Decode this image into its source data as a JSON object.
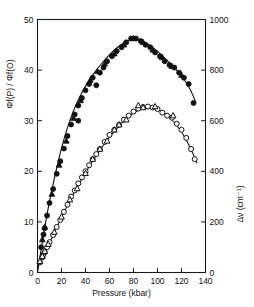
{
  "chart_data": {
    "type": "scatter",
    "title": "",
    "xlabel": "Pressure (kbar)",
    "ylabel": "Φf(P) / Φf(O)",
    "ylabel_right": "Δν (cm⁻¹)",
    "xlim": [
      0,
      140
    ],
    "ylim": [
      0,
      50
    ],
    "ylim_right": [
      0,
      1000
    ],
    "xticks": [
      0,
      20,
      40,
      60,
      80,
      100,
      120,
      140
    ],
    "yticks": [
      0,
      10,
      20,
      30,
      40,
      50
    ],
    "yticks_right": [
      0,
      200,
      400,
      600,
      800,
      1000
    ],
    "grid": false,
    "legend": "none",
    "series": [
      {
        "name": "Φf(P)/Φf(O) open circles",
        "axis": "left",
        "marker": "open-circle",
        "x": [
          2,
          4,
          5,
          6,
          8,
          10,
          13,
          16,
          19,
          22,
          25,
          28,
          31,
          34,
          37,
          40,
          43,
          46,
          49,
          52,
          56,
          60,
          64,
          68,
          72,
          76,
          80,
          84,
          88,
          92,
          96,
          100,
          104,
          108,
          112,
          116,
          120,
          124,
          128,
          131
        ],
        "y": [
          2.0,
          3.0,
          3.6,
          4.0,
          5.0,
          6.0,
          7.4,
          9.0,
          10.4,
          12.0,
          13.4,
          15.0,
          16.2,
          17.6,
          18.8,
          20.0,
          21.2,
          22.4,
          23.4,
          24.4,
          25.8,
          27.2,
          28.2,
          29.2,
          30.2,
          31.0,
          31.8,
          32.4,
          32.7,
          32.8,
          32.6,
          32.3,
          31.6,
          31.0,
          30.6,
          29.4,
          28.2,
          26.6,
          24.4,
          22.4
        ]
      },
      {
        "name": "Φf(P)/Φf(O) open triangles",
        "axis": "left",
        "marker": "open-triangle",
        "x": [
          2,
          4,
          6,
          9,
          14,
          20,
          27,
          33,
          40,
          46,
          52,
          58,
          64,
          68,
          74,
          84,
          88,
          98,
          113
        ],
        "y": [
          2.2,
          3.2,
          4.2,
          5.6,
          8.0,
          11.0,
          14.4,
          16.6,
          19.6,
          22.4,
          24.4,
          26.0,
          28.2,
          29.2,
          30.2,
          33.0,
          32.6,
          32.8,
          31.0
        ]
      },
      {
        "name": "Δν filled circles",
        "axis": "right",
        "marker": "filled-circle",
        "x": [
          3,
          5,
          6,
          8,
          10,
          13,
          16,
          19,
          22,
          25,
          28,
          31,
          34,
          34,
          37,
          40,
          43,
          46,
          49,
          52,
          55,
          58,
          62,
          66,
          70,
          74,
          78,
          82,
          86,
          90,
          94,
          98,
          102,
          106,
          110,
          114,
          118,
          122,
          126,
          130
        ],
        "y": [
          100,
          150,
          175,
          225,
          275,
          330,
          390,
          440,
          490,
          540,
          585,
          625,
          660,
          600,
          690,
          720,
          745,
          770,
          740,
          790,
          810,
          835,
          855,
          875,
          890,
          910,
          925,
          925,
          915,
          900,
          890,
          870,
          855,
          835,
          820,
          810,
          790,
          770,
          745,
          670
        ]
      },
      {
        "name": "Δν filled triangles",
        "axis": "right",
        "marker": "filled-triangle",
        "x": [
          4,
          6,
          12,
          18,
          24,
          30,
          36,
          44,
          50,
          56,
          64,
          72,
          80,
          88,
          96,
          104,
          112,
          120
        ],
        "y": [
          130,
          180,
          310,
          425,
          520,
          610,
          680,
          760,
          795,
          825,
          865,
          900,
          925,
          910,
          880,
          850,
          815,
          780
        ]
      }
    ],
    "curve_upper": {
      "name": "fitted curve upper",
      "x": [
        0,
        5,
        10,
        20,
        30,
        40,
        50,
        60,
        70,
        80,
        90,
        100,
        110,
        120,
        128,
        133
      ],
      "y": [
        1.0,
        3.4,
        5.8,
        11.0,
        15.6,
        19.8,
        23.6,
        26.8,
        29.6,
        31.6,
        32.8,
        32.4,
        30.8,
        28.0,
        24.4,
        21.6
      ]
    },
    "curve_lower": {
      "name": "fitted curve lower",
      "x": [
        0,
        5,
        10,
        20,
        30,
        40,
        50,
        60,
        70,
        80,
        90,
        100,
        110,
        120,
        128,
        132
      ],
      "y": [
        0,
        150,
        285,
        500,
        645,
        740,
        808,
        862,
        905,
        925,
        912,
        875,
        830,
        780,
        720,
        670
      ]
    }
  }
}
